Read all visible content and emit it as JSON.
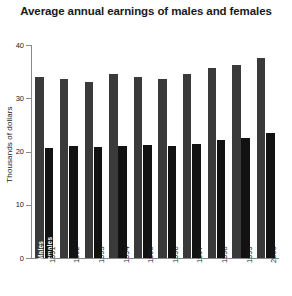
{
  "chart_data": {
    "type": "bar",
    "title": "Average annual earnings of males and females",
    "xlabel": "",
    "ylabel": "Thousands of dollars",
    "ylim": [
      0,
      40
    ],
    "yticks": [
      0,
      10,
      20,
      30,
      40
    ],
    "grid": false,
    "legend": "inline-bar-labels",
    "categories": [
      "1991",
      "1992",
      "1993",
      "1994",
      "1995",
      "1996",
      "1997",
      "1998",
      "1999",
      "2000"
    ],
    "series": [
      {
        "name": "Males",
        "color": "#3a3a3a",
        "values": [
          34.0,
          33.7,
          33.1,
          34.6,
          33.9,
          33.7,
          34.6,
          35.7,
          36.2,
          37.5
        ]
      },
      {
        "name": "Females",
        "color": "#121212",
        "values": [
          20.6,
          21.1,
          20.8,
          21.1,
          21.2,
          21.1,
          21.4,
          22.2,
          22.6,
          23.4
        ]
      }
    ]
  }
}
